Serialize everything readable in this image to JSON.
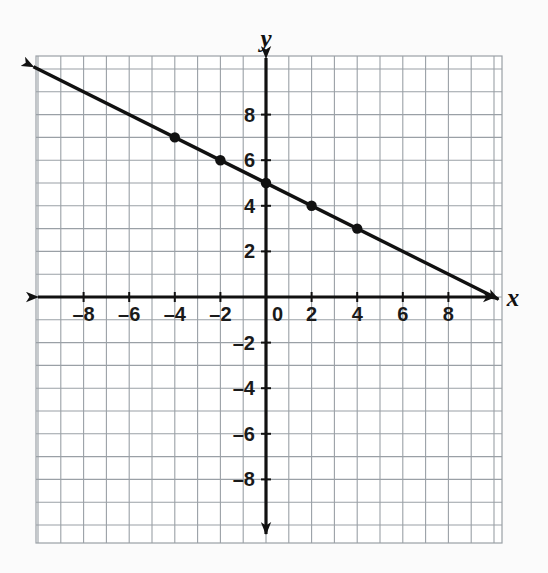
{
  "figure": {
    "background_color": "#fbfbfb",
    "grid_color": "#9aa0a6",
    "minor_grid_color": "#d9dde1",
    "axis_color": "#111111",
    "line_color": "#111111",
    "point_color": "#111111"
  },
  "chart_data": {
    "type": "line",
    "title": "",
    "subtitle": "",
    "xlabel": "x",
    "ylabel": "y",
    "xlim": [
      -10,
      10
    ],
    "ylim": [
      -10,
      10
    ],
    "grid": true,
    "legend": "none",
    "equation": "y = -0.5x + 5",
    "slope": -0.5,
    "intercept": 5,
    "x_ticks": [
      -8,
      -6,
      -4,
      -2,
      0,
      2,
      4,
      6,
      8
    ],
    "x_tick_labels": [
      "–8",
      "–6",
      "–4",
      "–2",
      "0",
      "2",
      "4",
      "6",
      "8"
    ],
    "y_ticks": [
      8,
      6,
      4,
      2,
      -2,
      -4,
      -6,
      -8
    ],
    "y_tick_labels": [
      "8",
      "6",
      "4",
      "2",
      "–2",
      "–4",
      "–6",
      "–8"
    ],
    "series": [
      {
        "name": "line",
        "x": [
          -10.2,
          10.2
        ],
        "values": [
          10.1,
          -0.1
        ],
        "arrow_start": true,
        "arrow_end": true
      }
    ],
    "points": [
      {
        "x": -4,
        "y": 7
      },
      {
        "x": -2,
        "y": 6
      },
      {
        "x": 0,
        "y": 5
      },
      {
        "x": 2,
        "y": 4
      },
      {
        "x": 4,
        "y": 3
      }
    ]
  },
  "axes": {
    "x_axis_label": "x",
    "y_axis_label": "y",
    "origin_label": "0"
  }
}
